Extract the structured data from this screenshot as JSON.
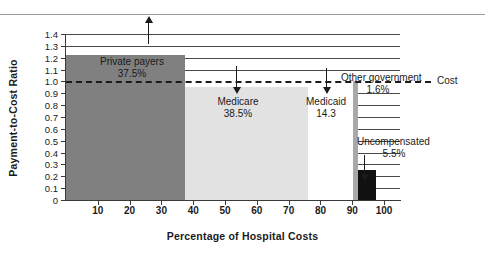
{
  "chart_data": {
    "type": "bar",
    "title": "",
    "xlabel": "Percentage of Hospital Costs",
    "ylabel": "Payment-to-Cost Ratio",
    "xlim": [
      0,
      105
    ],
    "ylim": [
      0,
      1.4
    ],
    "grid": true,
    "legend": "none",
    "xticks": [
      "10",
      "20",
      "30",
      "40",
      "50",
      "60",
      "70",
      "80",
      "90",
      "100"
    ],
    "xtick_values": [
      10,
      20,
      30,
      40,
      50,
      60,
      70,
      80,
      90,
      100
    ],
    "yticks": [
      "0",
      "0.1",
      "0.2",
      "0.3",
      "0.4",
      "0.5",
      "0.6",
      "0.7",
      "0.8",
      "0.9",
      "1.0",
      "1.1",
      "1.2",
      "1.3",
      "1.4"
    ],
    "ytick_values": [
      0,
      0.1,
      0.2,
      0.3,
      0.4,
      0.5,
      0.6,
      0.7,
      0.8,
      0.9,
      1.0,
      1.1,
      1.2,
      1.3,
      1.4
    ],
    "reference_line": {
      "value": 1.0,
      "label": "Cost",
      "style": "dashed"
    },
    "note": "Stacked-width marimekko style: bar width = share of hospital costs, bar height = payment-to-cost ratio",
    "segments": [
      {
        "name": "Private payers",
        "label": "Private payers",
        "share_label": "37.5%",
        "share": 37.5,
        "x_start": 0,
        "x_end": 37.5,
        "ratio": 1.22,
        "color": "#808080"
      },
      {
        "name": "Medicare",
        "label": "Medicare",
        "share_label": "38.5%",
        "share": 38.5,
        "x_start": 37.5,
        "x_end": 76.0,
        "ratio": 0.95,
        "color": "#e2e2e2"
      },
      {
        "name": "Medicaid",
        "label": "Medicaid",
        "share_label": "14.3",
        "share": 14.3,
        "x_start": 76.0,
        "x_end": 90.3,
        "ratio": 0.92,
        "color": "#ffffff"
      },
      {
        "name": "Other government",
        "label": "Other government",
        "share_label": "1.6%",
        "share": 1.6,
        "x_start": 90.3,
        "x_end": 91.9,
        "ratio": 1.0,
        "color": "#a8a8a8"
      },
      {
        "name": "Uncompensated",
        "label": "Uncompensated",
        "share_label": "5.5%",
        "share": 5.5,
        "x_start": 91.9,
        "x_end": 97.4,
        "ratio": 0.25,
        "color": "#111111"
      }
    ]
  },
  "annotations": {
    "cost_line_label": "Cost"
  }
}
